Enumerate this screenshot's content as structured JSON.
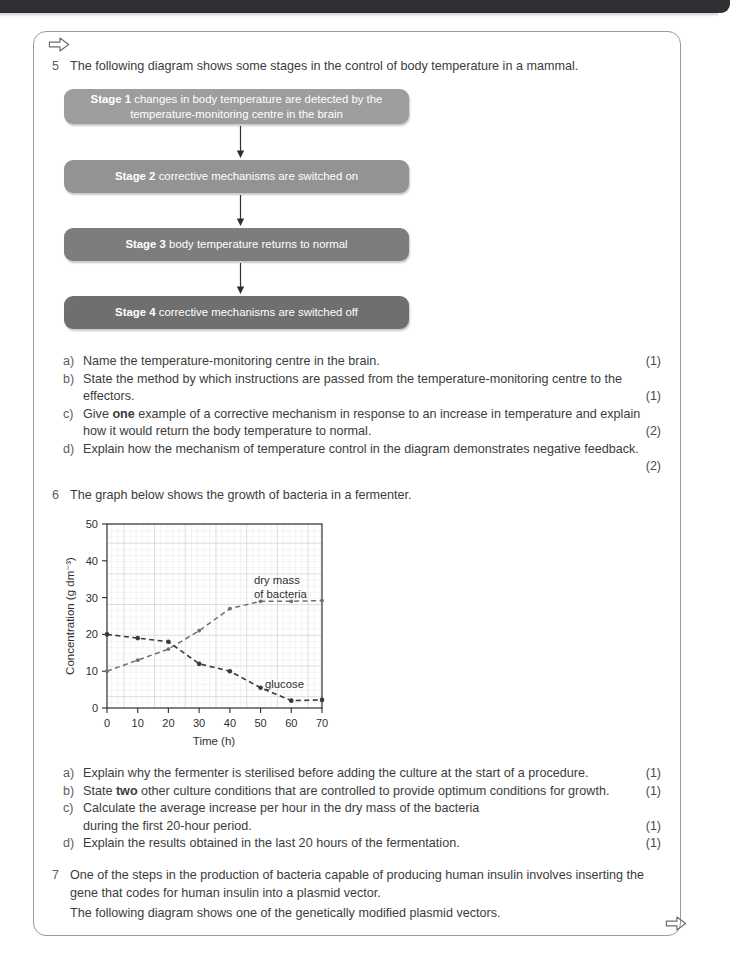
{
  "page": {
    "top_bar_color": "#2f3033",
    "panel_border_color": "#9b9b9b",
    "nav_arrow_top": "⇨",
    "nav_arrow_bottom": "⇨"
  },
  "question5": {
    "number": "5",
    "stem": "The following diagram shows some stages in the control of body temperature in a mammal.",
    "flowchart": {
      "stages": [
        {
          "label": "Stage 1",
          "text": " changes in body temperature are detected by the temperature-monitoring centre in the brain",
          "color": "#9d9d9d"
        },
        {
          "label": "Stage 2",
          "text": " corrective mechanisms are switched on",
          "color": "#939393"
        },
        {
          "label": "Stage 3",
          "text": " body temperature returns to normal",
          "color": "#7d7d7d"
        },
        {
          "label": "Stage 4",
          "text": " corrective mechanisms are switched off",
          "color": "#6f6f6f"
        }
      ]
    },
    "parts": [
      {
        "letter": "a)",
        "text": "Name the temperature-monitoring centre in the brain.",
        "marks": "(1)"
      },
      {
        "letter": "b)",
        "text": "State the method by which instructions are passed from the temperature-monitoring centre to the effectors.",
        "marks": "(1)"
      },
      {
        "letter": "c)",
        "text_pre": "Give ",
        "bold": "one",
        "text_post": " example of a corrective mechanism in response to an increase in temperature and explain how it would return the body temperature to normal.",
        "marks": "(2)"
      },
      {
        "letter": "d)",
        "text": "Explain how the mechanism of temperature control in the diagram demonstrates negative feedback.",
        "marks": "(2)"
      }
    ]
  },
  "question6": {
    "number": "6",
    "stem": "The graph below shows the growth of bacteria in a fermenter.",
    "parts": [
      {
        "letter": "a)",
        "text": "Explain why the fermenter is sterilised before adding the culture at the start of a procedure.",
        "marks": "(1)"
      },
      {
        "letter": "b)",
        "text_pre": "State ",
        "bold": "two",
        "text_post": " other culture conditions that are controlled to provide optimum conditions for growth.",
        "marks": "(1)"
      },
      {
        "letter": "c)",
        "text": "Calculate the average increase per hour in the dry mass of the bacteria during the first 20-hour period.",
        "marks": "(1)"
      },
      {
        "letter": "d)",
        "text": "Explain the results obtained in the last 20 hours of the fermentation.",
        "marks": "(1)"
      }
    ]
  },
  "question7": {
    "number": "7",
    "stem": "One of the steps in the production of bacteria capable of producing human insulin involves inserting the gene that codes for human insulin into a plasmid vector.",
    "follow": "The following diagram shows one of the genetically modified plasmid vectors."
  },
  "chart_data": {
    "type": "line",
    "title": "",
    "xlabel": "Time (h)",
    "ylabel": "Concentration (g dm⁻³)",
    "xlim": [
      0,
      70
    ],
    "ylim": [
      0,
      50
    ],
    "xticks": [
      0,
      10,
      20,
      30,
      40,
      50,
      60,
      70
    ],
    "yticks": [
      0,
      10,
      20,
      30,
      40,
      50
    ],
    "grid": true,
    "grid_minor_spacing": 2,
    "legend_position": "inline-annotation",
    "series": [
      {
        "name": "dry mass of bacteria",
        "x": [
          0,
          10,
          20,
          30,
          40,
          50,
          60,
          70
        ],
        "values": [
          10,
          13,
          16,
          21,
          27,
          29,
          29,
          29.2
        ],
        "style": "dashed",
        "color": "#6f6f6f",
        "annotation": "dry mass\nof bacteria",
        "annotation_line1": "dry mass",
        "annotation_line2": "of bacteria"
      },
      {
        "name": "glucose",
        "x": [
          0,
          10,
          20,
          30,
          40,
          50,
          60,
          70
        ],
        "values": [
          20,
          19,
          18,
          12,
          10,
          5.5,
          2,
          2.2
        ],
        "style": "dashed",
        "color": "#3a3a3a",
        "annotation": "glucose",
        "annotation_line1": "glucose",
        "annotation_line2": ""
      }
    ]
  }
}
